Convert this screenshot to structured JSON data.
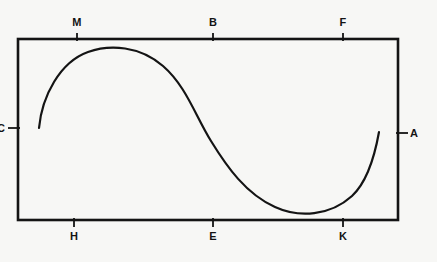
{
  "figure": {
    "title": "",
    "background_color": "#f7f7f5",
    "stroke_color": "#141414",
    "frame": {
      "left": 18,
      "top": 39,
      "right": 398,
      "bottom": 220
    },
    "axis_labels": {
      "top": [
        {
          "name": "M",
          "text": "M",
          "x": 77
        },
        {
          "name": "B",
          "text": "B",
          "x": 213
        },
        {
          "name": "F",
          "text": "F",
          "x": 343
        }
      ],
      "bottom": [
        {
          "name": "H",
          "text": "H",
          "x": 74
        },
        {
          "name": "E",
          "text": "E",
          "x": 213
        },
        {
          "name": "K",
          "text": "K",
          "x": 343
        }
      ],
      "left": [
        {
          "name": "C",
          "text": "C",
          "y": 128
        }
      ],
      "right": [
        {
          "name": "A",
          "text": "A",
          "y": 133
        }
      ]
    },
    "curve": {
      "type": "sigmoid-s-curve",
      "description": "Smooth S-shaped curve rising to a crest near M/B then falling to a trough before rising again toward A",
      "start_point": {
        "x": 39,
        "y": 128
      },
      "crest_point": {
        "x": 122,
        "y": 48
      },
      "inflection_point": {
        "x": 211,
        "y": 140
      },
      "trough_point": {
        "x": 295,
        "y": 213
      },
      "end_point": {
        "x": 379,
        "y": 132
      },
      "path": "M 39,128 C 42,96 60,62 88,52 C 110,44 140,46 163,66 C 186,86 195,115 211,141 C 227,167 246,194 275,207 C 299,218 330,216 352,196 C 366,183 374,160 379,132"
    }
  }
}
